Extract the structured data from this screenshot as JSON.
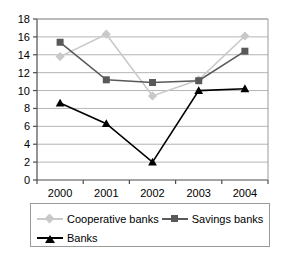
{
  "chart_data": {
    "type": "line",
    "title": "",
    "xlabel": "",
    "ylabel": "",
    "categories": [
      "2000",
      "2001",
      "2002",
      "2003",
      "2004"
    ],
    "ylim": [
      0,
      18
    ],
    "ytick_step": 2,
    "yticks": [
      "0",
      "2",
      "4",
      "6",
      "8",
      "10",
      "12",
      "14",
      "16",
      "18"
    ],
    "grid": true,
    "legend_position": "bottom",
    "series": [
      {
        "name": "Cooperative banks",
        "marker": "diamond",
        "color": "#c9c9c9",
        "values": [
          13.8,
          16.3,
          9.4,
          11.2,
          16.1
        ]
      },
      {
        "name": "Savings banks",
        "marker": "square",
        "color": "#595959",
        "values": [
          15.4,
          11.2,
          10.9,
          11.1,
          14.4
        ]
      },
      {
        "name": "Banks",
        "marker": "triangle",
        "color": "#000000",
        "values": [
          8.6,
          6.3,
          2.0,
          10.0,
          10.2
        ]
      }
    ]
  },
  "legend": {
    "items": [
      {
        "label": "Cooperative banks"
      },
      {
        "label": "Savings banks"
      },
      {
        "label": "Banks"
      }
    ]
  }
}
